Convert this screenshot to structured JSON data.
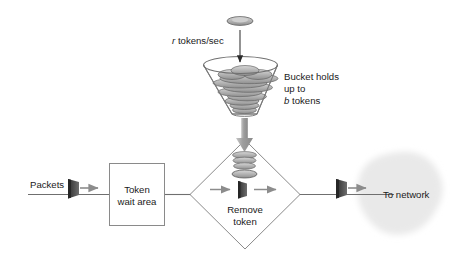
{
  "diagram": {
    "labels": {
      "token_rate": "tokens/sec",
      "token_rate_symbol": "r",
      "bucket_line1": "Bucket holds",
      "bucket_line2": "up to",
      "bucket_line3_symbol": "b",
      "bucket_line3": "tokens",
      "packets": "Packets",
      "wait_area_line1": "Token",
      "wait_area_line2": "wait area",
      "remove_line1": "Remove",
      "remove_line2": "token",
      "to_network": "To network"
    },
    "colors": {
      "background": "#ffffff",
      "line": "#7a7a7a",
      "box_border": "#8a8a8a",
      "text": "#1a1a1a",
      "token_fill": "#b3b3b3",
      "token_stroke": "#5a5a5a",
      "packet_dark": "#3d3d3d",
      "packet_mid": "#6b6b6b",
      "arrow_gray": "#8c8c8c",
      "cloud": "#e9e9e9",
      "big_arrow": "#9a9a9a"
    },
    "shapes": {
      "bucket": "funnel",
      "decision": "diamond",
      "network": "cloud",
      "queue": "rectangle"
    }
  }
}
